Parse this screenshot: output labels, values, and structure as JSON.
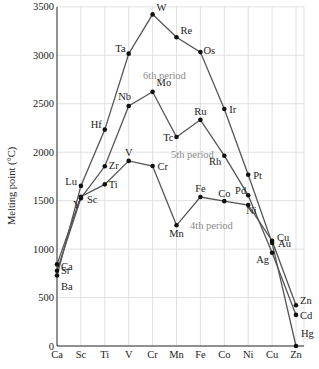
{
  "chart_data": {
    "type": "line",
    "title": "",
    "xlabel": "",
    "ylabel": "Melting point (°C)",
    "ylim": [
      0,
      3500
    ],
    "yticks": [
      0,
      500,
      1000,
      1500,
      2000,
      2500,
      3000,
      3500
    ],
    "grid": true,
    "categories": [
      "Ca",
      "Sc",
      "Ti",
      "V",
      "Cr",
      "Mn",
      "Fe",
      "Co",
      "Ni",
      "Cu",
      "Zn"
    ],
    "series": [
      {
        "name": "4th period",
        "elements": [
          "Ca",
          "Sc",
          "Ti",
          "V",
          "Cr",
          "Mn",
          "Fe",
          "Co",
          "Ni",
          "Cu",
          "Zn"
        ],
        "values": [
          842,
          1541,
          1668,
          1910,
          1857,
          1246,
          1538,
          1495,
          1455,
          1085,
          420
        ]
      },
      {
        "name": "5th period",
        "elements": [
          "Sr",
          "Y",
          "Zr",
          "Nb",
          "Mo",
          "Tc",
          "Ru",
          "Rh",
          "Pd",
          "Ag",
          "Cd"
        ],
        "values": [
          777,
          1526,
          1855,
          2477,
          2623,
          2157,
          2334,
          1964,
          1555,
          962,
          321
        ]
      },
      {
        "name": "6th period",
        "elements": [
          "Ba",
          "Lu",
          "Hf",
          "Ta",
          "W",
          "Re",
          "Os",
          "Ir",
          "Pt",
          "Au",
          "Hg"
        ],
        "values": [
          727,
          1652,
          2233,
          3017,
          3422,
          3186,
          3033,
          2446,
          1768,
          1064,
          -39
        ]
      }
    ],
    "annotations": [
      "4th period",
      "5th period",
      "6th period"
    ]
  },
  "labels": {
    "ylabel": "Melting point (°C)",
    "period4": "4th period",
    "period5": "5th period",
    "period6": "6th period"
  }
}
